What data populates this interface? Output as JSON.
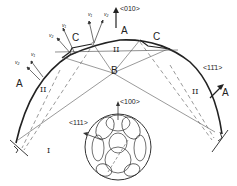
{
  "diagram": {
    "region_labels": {
      "A_top": "A",
      "A_left": "A",
      "A_right": "A",
      "B": "B",
      "C_left": "C",
      "C_right": "C",
      "I": "I",
      "II_top": "II",
      "II_left": "II",
      "II_right": "II"
    },
    "direction_labels": {
      "d010": "<010>",
      "d111": "<111>",
      "d11_1": "<11̄1>",
      "d100": "<100>"
    },
    "vector_labels": {
      "v1_a": "v₁",
      "v2_a": "v₂",
      "v1_b": "v₁",
      "v2_b": "v₂",
      "v1_c": "v₁",
      "v2_c": "v₂"
    },
    "colors": {
      "stroke": "#222222",
      "thin": "#555555",
      "background": "#ffffff"
    }
  }
}
